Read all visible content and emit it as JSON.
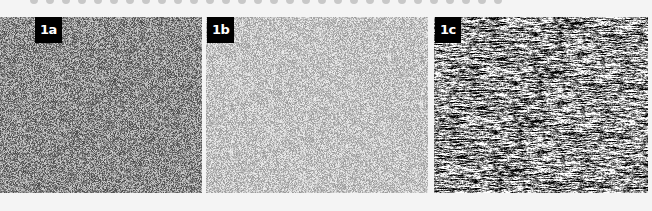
{
  "figure": {
    "panels": [
      {
        "id": "1a",
        "label": "1a",
        "x": 0,
        "width": 202,
        "label_left": 35,
        "texture": "fine",
        "base_gray": 140,
        "contrast": 70
      },
      {
        "id": "1b",
        "label": "1b",
        "x": 206,
        "width": 222,
        "label_left": 1,
        "texture": "fine",
        "base_gray": 195,
        "contrast": 45
      },
      {
        "id": "1c",
        "label": "1c",
        "x": 434,
        "width": 214,
        "label_left": 1,
        "texture": "streaked",
        "base_gray": 150,
        "contrast": 110
      }
    ],
    "top_dots_count": 30,
    "colors": {
      "background": "#f4f4f4",
      "label_bg": "#000000",
      "label_text": "#ffffff",
      "dots": "#c8c8c8"
    }
  }
}
